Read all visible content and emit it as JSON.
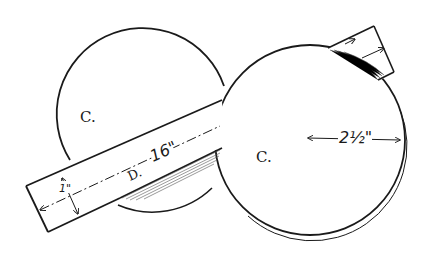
{
  "diagram": {
    "type": "technical-line-drawing",
    "colors": {
      "ink": "#1a1a1a",
      "paper": "#ffffff",
      "hatch": "#555555"
    },
    "labels": {
      "left_circle": "C.",
      "right_circle": "C.",
      "strip": "D.",
      "strip_length": "16\"",
      "strip_width": "1\"",
      "radius": "2½\""
    },
    "elements": [
      {
        "id": "left-circle",
        "shape": "circle",
        "label": "C."
      },
      {
        "id": "right-circle",
        "shape": "circle",
        "label": "C.",
        "dimension": "2½\" radius"
      },
      {
        "id": "strip-d",
        "shape": "rectangle-strip",
        "label": "D.",
        "length": "16\"",
        "width": "1\""
      },
      {
        "id": "strip-end-right",
        "shape": "strip-end",
        "note": "continuation of strip over right circle with arrows"
      }
    ]
  }
}
